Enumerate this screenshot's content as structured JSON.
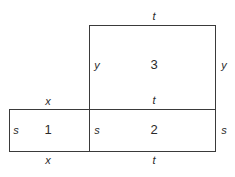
{
  "diagram": {
    "regions": [
      {
        "id": "3",
        "label": "3",
        "top": "t",
        "left": "y",
        "right": "y"
      },
      {
        "id": "1",
        "label": "1",
        "top": "x",
        "bottom": "x",
        "left": "s"
      },
      {
        "id": "2",
        "label": "2",
        "top": "t",
        "bottom": "t",
        "left": "s",
        "right": "s"
      }
    ],
    "edge_labels": {
      "r3_top": "t",
      "r3_left": "y",
      "r3_right": "y",
      "r1_top": "x",
      "r1_bottom": "x",
      "r1_left": "s",
      "r2_top": "t",
      "r2_bottom": "t",
      "r2_left": "s",
      "r2_right": "s"
    }
  }
}
